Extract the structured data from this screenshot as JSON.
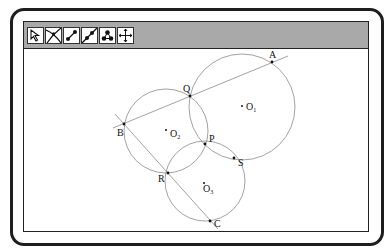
{
  "toolbar": {
    "tools": [
      {
        "name": "select-arrow",
        "label": "Select"
      },
      {
        "name": "point-intersection",
        "label": "Intersection"
      },
      {
        "name": "segment",
        "label": "Segment"
      },
      {
        "name": "line",
        "label": "Line"
      },
      {
        "name": "circle-three-points",
        "label": "Circles"
      },
      {
        "name": "move-pan",
        "label": "Move"
      }
    ]
  },
  "diagram": {
    "circles": [
      {
        "center": "O1",
        "cx": 242,
        "cy": 107,
        "r": 53
      },
      {
        "center": "O2",
        "cx": 166,
        "cy": 131,
        "r": 42
      },
      {
        "center": "O3",
        "cx": 205,
        "cy": 181,
        "r": 40
      }
    ],
    "points": {
      "A": {
        "label": "A",
        "x": 272,
        "y": 62
      },
      "B": {
        "label": "B",
        "x": 124,
        "y": 124
      },
      "C": {
        "label": "C",
        "x": 210,
        "y": 221
      },
      "P": {
        "label": "P",
        "x": 205,
        "y": 144
      },
      "Q": {
        "label": "Q",
        "x": 190,
        "y": 96
      },
      "R": {
        "label": "R",
        "x": 168,
        "y": 173
      },
      "S": {
        "label": "S",
        "x": 234,
        "y": 158
      }
    },
    "centers": {
      "O1": {
        "letter": "O",
        "sub": "1",
        "x": 242,
        "y": 107
      },
      "O2": {
        "letter": "O",
        "sub": "2",
        "x": 166,
        "y": 131
      },
      "O3": {
        "letter": "O",
        "sub": "3",
        "x": 204,
        "y": 185
      }
    },
    "lines": [
      {
        "name": "line-BA",
        "through": [
          "B",
          "A"
        ]
      },
      {
        "name": "line-BC",
        "through": [
          "B",
          "C"
        ]
      }
    ]
  }
}
